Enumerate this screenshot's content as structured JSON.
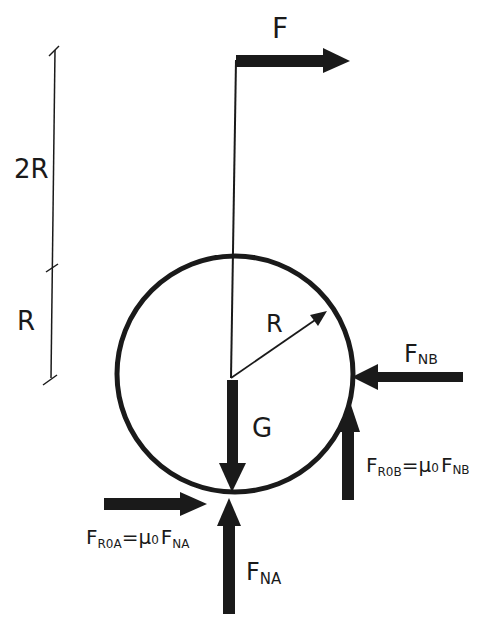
{
  "diagram": {
    "type": "free-body-diagram",
    "colors": {
      "ink": "#1a1a1a",
      "background": "#ffffff"
    },
    "dimensions": {
      "upper": "2R",
      "lower": "R"
    },
    "radius_label": "R",
    "forces": {
      "applied": {
        "symbol": "F",
        "direction": "right"
      },
      "weight": {
        "symbol": "G",
        "direction": "down"
      },
      "normal_b": {
        "main": "F",
        "sub": "NB",
        "direction": "left"
      },
      "friction_b": {
        "main": "F",
        "sub": "R0B",
        "eq": "=",
        "mu": "μ",
        "mu_sub": "0",
        "rhs_main": "F",
        "rhs_sub": "NB",
        "direction": "up"
      },
      "normal_a": {
        "main": "F",
        "sub": "NA",
        "direction": "up"
      },
      "friction_a": {
        "main": "F",
        "sub": "R0A",
        "eq": "=",
        "mu": "μ",
        "mu_sub": "0",
        "rhs_main": "F",
        "rhs_sub": "NA",
        "direction": "right"
      }
    }
  }
}
